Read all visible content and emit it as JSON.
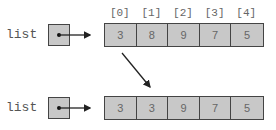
{
  "top": {
    "label": "list",
    "indices": [
      "[0]",
      "[1]",
      "[2]",
      "[3]",
      "[4]"
    ],
    "values": [
      "3",
      "8",
      "9",
      "7",
      "5"
    ]
  },
  "bottom": {
    "label": "list",
    "values": [
      "3",
      "3",
      "9",
      "7",
      "5"
    ]
  },
  "colors": {
    "cell_fill": "#c8c8c8",
    "border": "#444444",
    "text": "#666666"
  }
}
